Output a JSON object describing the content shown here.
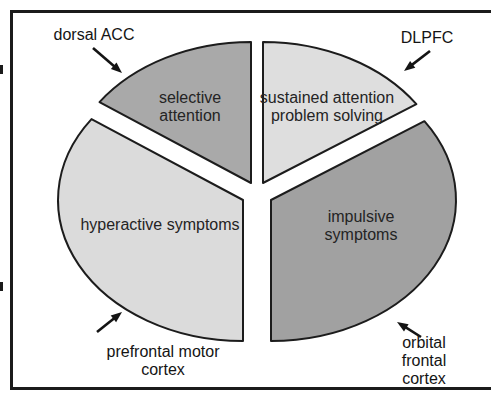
{
  "figure": {
    "background": "#ffffff",
    "frame_color": "#1b1b1b"
  },
  "diagram": {
    "type": "exploded-pie",
    "ellipse": {
      "rx": 185,
      "ry": 141
    },
    "stroke": "#1c1c1c",
    "stroke_width": 2,
    "wedges": [
      {
        "id": "selective-attention",
        "label": "selective\nattention",
        "fill": "#a9a9a9",
        "start_angle": 90,
        "end_angle": 145,
        "cx": 251,
        "cy": 183,
        "label_x": 190,
        "label_y": 107
      },
      {
        "id": "sustained-attention-problem-solving",
        "label": "sustained attention\nproblem solving",
        "fill": "#dedede",
        "start_angle": 34,
        "end_angle": 90,
        "cx": 263,
        "cy": 183,
        "label_x": 327,
        "label_y": 107
      },
      {
        "id": "hyperactive-symptoms",
        "label": "hyperactive symptoms",
        "fill": "#dbdbdb",
        "start_angle": 145,
        "end_angle": 270,
        "cx": 243,
        "cy": 200,
        "label_x": 160,
        "label_y": 225
      },
      {
        "id": "impulsive-symptoms",
        "label": "impulsive symptoms",
        "fill": "#a1a1a1",
        "start_angle": 270,
        "end_angle": 394,
        "cx": 271,
        "cy": 200,
        "label_x": 361,
        "label_y": 226
      }
    ],
    "callouts": [
      {
        "id": "dorsal-acc",
        "text": "dorsal ACC",
        "x": 94,
        "y": 35,
        "arrow": {
          "x1": 93,
          "y1": 48,
          "x2": 122,
          "y2": 73
        }
      },
      {
        "id": "dlpfc",
        "text": "DLPFC",
        "x": 427,
        "y": 38,
        "arrow": {
          "x1": 430,
          "y1": 51,
          "x2": 404,
          "y2": 71
        }
      },
      {
        "id": "prefrontal-motor-cortex",
        "text": "prefrontal motor\ncortex",
        "x": 163,
        "y": 361,
        "arrow": {
          "x1": 97,
          "y1": 332,
          "x2": 122,
          "y2": 312
        }
      },
      {
        "id": "orbital-frontal-cortex",
        "text": "orbital frontal\ncortex",
        "x": 424,
        "y": 361,
        "arrow": {
          "x1": 421,
          "y1": 337,
          "x2": 397,
          "y2": 322
        }
      }
    ],
    "arrow_color": "#141414"
  }
}
